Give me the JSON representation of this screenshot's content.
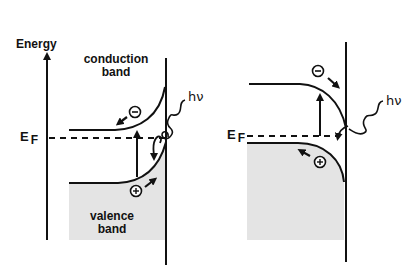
{
  "diagram": {
    "type": "band-diagram",
    "panels": [
      {
        "id": "left",
        "axis_label": "Energy",
        "fermi_label": "E",
        "fermi_sub": "F",
        "conduction_label_line1": "conduction",
        "conduction_label_line2": "band",
        "valence_label_line1": "valence",
        "valence_label_line2": "band",
        "photon_label": "hν",
        "electron_symbol": "−",
        "hole_symbol": "+",
        "band_bending": "upward (toward interface)"
      },
      {
        "id": "right",
        "fermi_label": "E",
        "fermi_sub": "F",
        "photon_label": "hν",
        "electron_symbol": "−",
        "hole_symbol": "+",
        "band_bending": "downward (toward interface)"
      }
    ],
    "colors": {
      "line": "#111111",
      "valence_fill": "#e4e4e4",
      "background": "#ffffff"
    }
  }
}
